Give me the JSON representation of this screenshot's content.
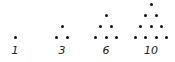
{
  "diagram": {
    "figures": [
      {
        "label": "1",
        "rows": 1,
        "cx": 15
      },
      {
        "label": "3",
        "rows": 2,
        "cx": 62
      },
      {
        "label": "6",
        "rows": 3,
        "cx": 106
      },
      {
        "label": "10",
        "rows": 4,
        "cx": 151
      }
    ],
    "dot_spacing_x": 10.5,
    "dot_spacing_y": 10.7,
    "base_y": 37,
    "dot_color": "#111111"
  }
}
